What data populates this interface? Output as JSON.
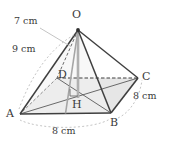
{
  "figure": {
    "kind": "square-pyramid-diagram",
    "apex_label": "O",
    "base_labels": [
      "A",
      "B",
      "C",
      "D"
    ],
    "center_label": "H",
    "colors": {
      "stroke": "#4a4a4a",
      "hidden_stroke": "#8a8a8a",
      "base_fill": "#e6e6e6",
      "altitude": "#a8a8a8",
      "text": "#3a3a3a"
    }
  },
  "vertices": {
    "O": {
      "label": "O",
      "x": 78,
      "y": 30,
      "label_x": 72,
      "label_y": 9
    },
    "A": {
      "label": "A",
      "x": 20,
      "y": 114,
      "label_x": 6,
      "label_y": 110
    },
    "B": {
      "label": "B",
      "x": 111,
      "y": 113,
      "label_x": 110,
      "label_y": 117
    },
    "C": {
      "label": "C",
      "x": 138,
      "y": 78,
      "label_x": 142,
      "label_y": 72
    },
    "D": {
      "label": "D",
      "x": 57,
      "y": 78,
      "label_x": 58,
      "label_y": 70
    },
    "H": {
      "label": "H",
      "x": 78,
      "y": 96,
      "label_x": 73,
      "label_y": 100
    }
  },
  "dimensions": [
    {
      "name": "slant-height-OM",
      "text": "7 cm",
      "label_x": 16,
      "label_y": 17
    },
    {
      "name": "lateral-edge-OA",
      "text": "9 cm",
      "label_x": 13,
      "label_y": 45
    },
    {
      "name": "base-edge-BC",
      "text": "8 cm",
      "label_x": 134,
      "label_y": 92
    },
    {
      "name": "base-edge-AB",
      "text": "8 cm",
      "label_x": 53,
      "label_y": 127
    }
  ]
}
